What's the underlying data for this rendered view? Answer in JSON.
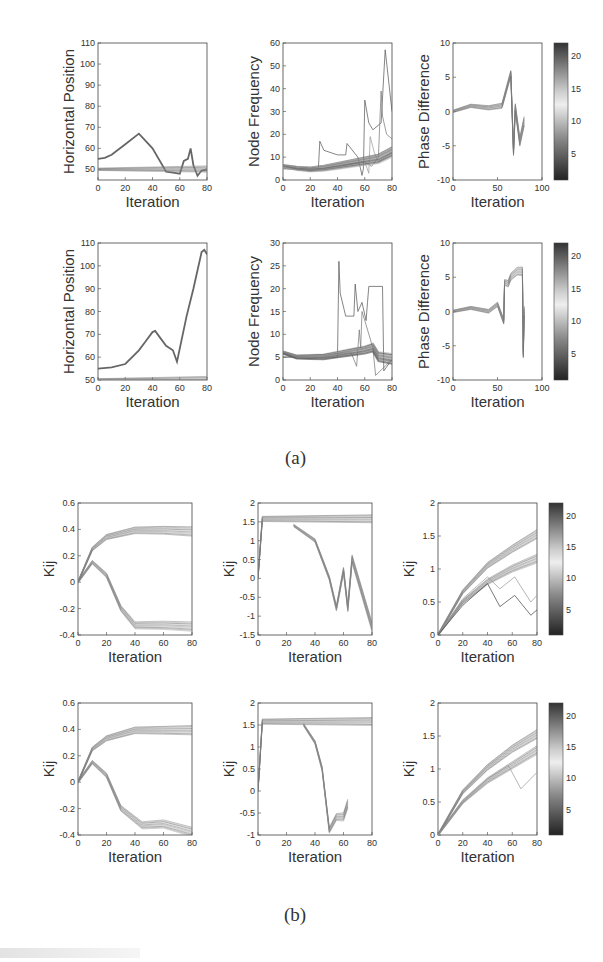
{
  "figure": {
    "caption_a": "(a)",
    "caption_b": "(b)"
  },
  "chart_data": [
    {
      "id": "a-row1-position",
      "type": "line",
      "title": "",
      "xlabel": "Iteration",
      "ylabel": "Horizontal Position",
      "xlim": [
        0,
        80
      ],
      "ylim": [
        45,
        110
      ],
      "xticks": [
        0,
        20,
        40,
        60,
        80
      ],
      "yticks": [
        50,
        60,
        70,
        80,
        90,
        100,
        110
      ],
      "series": [
        {
          "name": "leader",
          "x": [
            0,
            5,
            10,
            20,
            30,
            40,
            50,
            55,
            60,
            63,
            66,
            68,
            70,
            73,
            76,
            80
          ],
          "values": [
            55,
            55.5,
            57,
            62,
            67,
            60,
            49,
            48.5,
            48,
            54,
            55,
            60,
            52,
            47,
            49.5,
            50
          ]
        },
        {
          "name": "followers (band)",
          "x": [
            0,
            80
          ],
          "values": [
            50,
            50
          ]
        }
      ]
    },
    {
      "id": "a-row1-frequency",
      "type": "line",
      "xlabel": "Iteration",
      "ylabel": "Node Frequency",
      "xlim": [
        0,
        80
      ],
      "ylim": [
        0,
        60
      ],
      "xticks": [
        0,
        20,
        40,
        60,
        80
      ],
      "yticks": [
        0,
        10,
        20,
        30,
        40,
        50,
        60
      ],
      "series": [
        {
          "name": "light-1",
          "x": [
            0,
            26,
            27,
            30,
            40,
            46,
            47,
            55,
            58,
            59,
            60,
            63,
            66,
            72,
            75,
            80
          ],
          "values": [
            5,
            5,
            17,
            13,
            11,
            11,
            16,
            10,
            2,
            5,
            35,
            25,
            22,
            25,
            57,
            30
          ]
        },
        {
          "name": "dark-1",
          "x": [
            0,
            20,
            40,
            60,
            65,
            70,
            72,
            73,
            76,
            80
          ],
          "values": [
            5,
            4,
            6,
            8,
            6,
            10,
            39,
            28,
            20,
            18
          ]
        },
        {
          "name": "mid-1",
          "x": [
            0,
            20,
            40,
            60,
            63,
            64,
            67,
            70,
            80
          ],
          "values": [
            5,
            4.5,
            6,
            8,
            3,
            19,
            12,
            8,
            12
          ]
        },
        {
          "name": "thick-mean",
          "x": [
            0,
            10,
            20,
            30,
            40,
            50,
            60,
            70,
            80
          ],
          "values": [
            6,
            5,
            4.5,
            5,
            6,
            7,
            8,
            9,
            12
          ]
        }
      ]
    },
    {
      "id": "a-row1-phase",
      "type": "line",
      "xlabel": "Iteration",
      "ylabel": "Phase Difference",
      "xlim": [
        0,
        100
      ],
      "ylim": [
        -10,
        10
      ],
      "xticks": [
        0,
        50,
        100
      ],
      "yticks": [
        -10,
        -5,
        0,
        5,
        10
      ],
      "colorbar": {
        "ticks": [
          5,
          10,
          15,
          20
        ],
        "range": [
          1,
          22
        ]
      },
      "series": [
        {
          "name": "spread",
          "x": [
            0,
            20,
            40,
            55,
            65,
            68,
            70,
            75,
            80
          ],
          "values": [
            0,
            0.8,
            0.5,
            0.8,
            5.5,
            -6,
            0.5,
            -4.5,
            -1.5
          ]
        }
      ]
    },
    {
      "id": "a-row2-position",
      "type": "line",
      "xlabel": "Iteration",
      "ylabel": "Horizontal Position",
      "xlim": [
        0,
        80
      ],
      "ylim": [
        50,
        110
      ],
      "xticks": [
        0,
        20,
        40,
        60,
        80
      ],
      "yticks": [
        50,
        60,
        70,
        80,
        90,
        100,
        110
      ],
      "series": [
        {
          "name": "leader",
          "x": [
            0,
            10,
            20,
            30,
            35,
            40,
            42,
            45,
            50,
            55,
            58,
            65,
            70,
            76,
            78,
            80
          ],
          "values": [
            55,
            55.5,
            57,
            63,
            67,
            71,
            71.5,
            69,
            65,
            63,
            58,
            78,
            90,
            106,
            107,
            105
          ]
        },
        {
          "name": "followers (band)",
          "x": [
            0,
            80
          ],
          "values": [
            50,
            50
          ]
        }
      ]
    },
    {
      "id": "a-row2-frequency",
      "type": "line",
      "xlabel": "Iteration",
      "ylabel": "Node Frequency",
      "xlim": [
        0,
        80
      ],
      "ylim": [
        0,
        30
      ],
      "xticks": [
        0,
        20,
        40,
        60,
        80
      ],
      "yticks": [
        0,
        5,
        10,
        15,
        20,
        25,
        30
      ],
      "series": [
        {
          "name": "light-1",
          "x": [
            0,
            40,
            41,
            42,
            46,
            50,
            52,
            53,
            55,
            58,
            61,
            62,
            63,
            73,
            74,
            80
          ],
          "values": [
            5,
            5,
            26,
            19,
            14,
            14,
            14,
            21,
            15,
            17,
            13,
            17,
            20.5,
            20.5,
            2,
            4.5
          ]
        },
        {
          "name": "dark-1",
          "x": [
            0,
            50,
            54,
            56,
            57,
            58,
            60,
            66,
            68,
            80
          ],
          "values": [
            5,
            6,
            3,
            11,
            7,
            15,
            13,
            7,
            1,
            4.5
          ]
        },
        {
          "name": "thick-mean",
          "x": [
            0,
            10,
            20,
            30,
            40,
            50,
            60,
            66,
            70,
            80
          ],
          "values": [
            6,
            5,
            5,
            5,
            5.5,
            6,
            6.5,
            7,
            5,
            4.5
          ]
        }
      ]
    },
    {
      "id": "a-row2-phase",
      "type": "line",
      "xlabel": "Iteration",
      "ylabel": "Phase Difference",
      "xlim": [
        0,
        100
      ],
      "ylim": [
        -10,
        10
      ],
      "xticks": [
        0,
        50,
        100
      ],
      "yticks": [
        -10,
        -5,
        0,
        5,
        10
      ],
      "colorbar": {
        "ticks": [
          5,
          10,
          15,
          20
        ],
        "range": [
          1,
          22
        ]
      },
      "series": [
        {
          "name": "spread",
          "x": [
            0,
            20,
            40,
            50,
            57,
            58,
            62,
            65,
            72,
            78,
            79,
            80
          ],
          "values": [
            0,
            0.5,
            0,
            1,
            -1.5,
            4.2,
            4,
            5,
            5.8,
            5.8,
            -6.2,
            0
          ]
        }
      ]
    },
    {
      "id": "b-row1-kij-a",
      "type": "line",
      "xlabel": "Iteration",
      "ylabel": "Kij",
      "xlim": [
        0,
        80
      ],
      "ylim": [
        -0.4,
        0.6
      ],
      "xticks": [
        0,
        20,
        40,
        60,
        80
      ],
      "yticks": [
        -0.4,
        -0.2,
        0,
        0.2,
        0.4,
        0.6
      ],
      "series": [
        {
          "name": "envelope-upper",
          "x": [
            0,
            10,
            20,
            40,
            60,
            80
          ],
          "values": [
            0,
            0.25,
            0.34,
            0.39,
            0.39,
            0.38
          ]
        },
        {
          "name": "envelope-lower",
          "x": [
            0,
            10,
            20,
            30,
            40,
            60,
            80
          ],
          "values": [
            0,
            0.15,
            0.05,
            -0.2,
            -0.33,
            -0.33,
            -0.34
          ]
        }
      ]
    },
    {
      "id": "b-row1-kij-b",
      "type": "line",
      "xlabel": "Iteration",
      "ylabel": "Kij",
      "xlim": [
        0,
        80
      ],
      "ylim": [
        -1.5,
        2
      ],
      "xticks": [
        0,
        20,
        40,
        60,
        80
      ],
      "yticks": [
        -1.5,
        -1,
        -0.5,
        0,
        0.5,
        1,
        1.5,
        2
      ],
      "series": [
        {
          "name": "plateau",
          "x": [
            0,
            3,
            80
          ],
          "values": [
            0,
            1.57,
            1.57
          ]
        },
        {
          "name": "drop-envelope",
          "x": [
            25,
            40,
            50,
            55,
            60,
            63,
            66,
            80
          ],
          "values": [
            1.4,
            1.0,
            0.0,
            -0.8,
            0.2,
            -0.8,
            0.5,
            -1.3
          ]
        }
      ]
    },
    {
      "id": "b-row1-kij-c",
      "type": "line",
      "xlabel": "Iteration",
      "ylabel": "Kij",
      "xlim": [
        0,
        80
      ],
      "ylim": [
        0,
        2
      ],
      "xticks": [
        0,
        20,
        40,
        60,
        80
      ],
      "yticks": [
        0,
        0.5,
        1,
        1.5,
        2
      ],
      "colorbar": {
        "ticks": [
          5,
          10,
          15,
          20
        ],
        "range": [
          1,
          22
        ]
      },
      "series": [
        {
          "name": "upper",
          "x": [
            0,
            20,
            40,
            60,
            80
          ],
          "values": [
            0,
            0.65,
            1.05,
            1.3,
            1.52
          ]
        },
        {
          "name": "lower",
          "x": [
            0,
            20,
            40,
            60,
            80
          ],
          "values": [
            0,
            0.5,
            0.8,
            1.0,
            1.15
          ]
        },
        {
          "name": "dip-1",
          "x": [
            0,
            20,
            40,
            50,
            62,
            75,
            80
          ],
          "values": [
            0,
            0.55,
            0.88,
            0.7,
            0.88,
            0.5,
            0.6
          ]
        },
        {
          "name": "dip-2",
          "x": [
            0,
            20,
            40,
            50,
            62,
            75,
            80
          ],
          "values": [
            0,
            0.45,
            0.78,
            0.43,
            0.6,
            0.3,
            0.38
          ]
        }
      ]
    },
    {
      "id": "b-row2-kij-a",
      "type": "line",
      "xlabel": "Iteration",
      "ylabel": "Kij",
      "xlim": [
        0,
        80
      ],
      "ylim": [
        -0.4,
        0.6
      ],
      "xticks": [
        0,
        20,
        40,
        60,
        80
      ],
      "yticks": [
        -0.4,
        -0.2,
        0,
        0.2,
        0.4,
        0.6
      ],
      "series": [
        {
          "name": "envelope-upper",
          "x": [
            0,
            10,
            20,
            40,
            60,
            80
          ],
          "values": [
            0,
            0.25,
            0.33,
            0.39,
            0.39,
            0.39
          ]
        },
        {
          "name": "envelope-lower",
          "x": [
            0,
            10,
            20,
            30,
            45,
            60,
            80
          ],
          "values": [
            0,
            0.15,
            0.05,
            -0.2,
            -0.33,
            -0.32,
            -0.38
          ]
        }
      ]
    },
    {
      "id": "b-row2-kij-b",
      "type": "line",
      "xlabel": "Iteration",
      "ylabel": "Kij",
      "xlim": [
        0,
        80
      ],
      "ylim": [
        -1,
        2
      ],
      "xticks": [
        0,
        20,
        40,
        60,
        80
      ],
      "yticks": [
        -1,
        -0.5,
        0,
        0.5,
        1,
        1.5,
        2
      ],
      "series": [
        {
          "name": "plateau",
          "x": [
            0,
            3,
            80
          ],
          "values": [
            0,
            1.57,
            1.57
          ]
        },
        {
          "name": "drop-envelope",
          "x": [
            32,
            40,
            45,
            50,
            55,
            60,
            63
          ],
          "values": [
            1.5,
            1.1,
            0.5,
            -0.9,
            -0.6,
            -0.6,
            -0.3
          ]
        }
      ]
    },
    {
      "id": "b-row2-kij-c",
      "type": "line",
      "xlabel": "Iteration",
      "ylabel": "Kij",
      "xlim": [
        0,
        80
      ],
      "ylim": [
        0,
        2
      ],
      "xticks": [
        0,
        20,
        40,
        60,
        80
      ],
      "yticks": [
        0,
        0.5,
        1,
        1.5,
        2
      ],
      "colorbar": {
        "ticks": [
          5,
          10,
          15,
          20
        ],
        "range": [
          1,
          22
        ]
      },
      "series": [
        {
          "name": "upper",
          "x": [
            0,
            20,
            40,
            60,
            80
          ],
          "values": [
            0,
            0.65,
            1.02,
            1.3,
            1.52
          ]
        },
        {
          "name": "lower",
          "x": [
            0,
            20,
            40,
            60,
            80
          ],
          "values": [
            0,
            0.5,
            0.82,
            1.05,
            1.28
          ]
        },
        {
          "name": "dip",
          "x": [
            0,
            20,
            40,
            57,
            67,
            80
          ],
          "values": [
            0,
            0.5,
            0.85,
            1.05,
            0.7,
            0.95
          ]
        }
      ]
    }
  ]
}
